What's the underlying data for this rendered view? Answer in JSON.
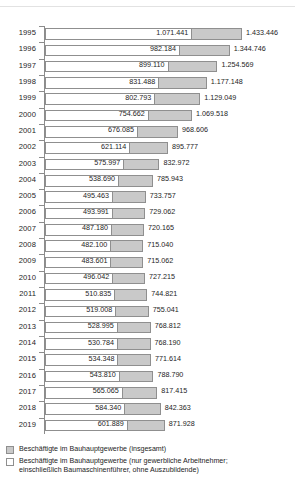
{
  "chart_data": {
    "type": "bar",
    "orientation": "horizontal",
    "title": "",
    "subtitle": "",
    "xlabel": "",
    "ylabel": "",
    "grid": false,
    "legend_position": "bottom-left",
    "xlim": [
      0,
      1433446
    ],
    "categories": [
      "1995",
      "1996",
      "1997",
      "1998",
      "1999",
      "2000",
      "2001",
      "2002",
      "2003",
      "2004",
      "2005",
      "2006",
      "2007",
      "2008",
      "2009",
      "2010",
      "2011",
      "2012",
      "2013",
      "2014",
      "2015",
      "2016",
      "2017",
      "2018",
      "2019"
    ],
    "series": [
      {
        "name": "Beschäftigte im Bauhauptgewerbe (insgesamt)",
        "color": "#c9c9c9",
        "values": [
          1433446,
          1344746,
          1254569,
          1177148,
          1129049,
          1069518,
          968606,
          895777,
          832972,
          785943,
          733757,
          729062,
          720165,
          715040,
          715062,
          727215,
          744821,
          755041,
          768812,
          768190,
          771614,
          788790,
          817415,
          842363,
          871928
        ],
        "labels": [
          "1.433.446",
          "1.344.746",
          "1.254.569",
          "1.177.148",
          "1.129.049",
          "1.069.518",
          "968.606",
          "895.777",
          "832.972",
          "785.943",
          "733.757",
          "729.062",
          "720.165",
          "715.040",
          "715.062",
          "727.215",
          "744.821",
          "755.041",
          "768.812",
          "768.190",
          "771.614",
          "788.790",
          "817.415",
          "842.363",
          "871.928"
        ]
      },
      {
        "name": "Beschäftigte im Bauhauptgewerbe (nur gewerbliche Arbeitnehmer; einschließlich Baumaschinenführer, ohne Auszubildende)",
        "color": "#ffffff",
        "values": [
          1071441,
          982184,
          899110,
          831488,
          802793,
          754662,
          676085,
          621114,
          575997,
          538690,
          495463,
          493991,
          487180,
          482100,
          483601,
          496042,
          510835,
          519008,
          528995,
          530784,
          534348,
          543810,
          565065,
          584340,
          601889
        ],
        "labels": [
          "1.071.441",
          "982.184",
          "899.110",
          "831.488",
          "802.793",
          "754.662",
          "676.085",
          "621.114",
          "575.997",
          "538.690",
          "495.463",
          "493.991",
          "487.180",
          "482.100",
          "483.601",
          "496.042",
          "510.835",
          "519.008",
          "528.995",
          "530.784",
          "534.348",
          "543.810",
          "565.065",
          "584.340",
          "601.889"
        ]
      }
    ]
  },
  "legend": {
    "items": [
      {
        "swatch": "total",
        "line1": "Beschäftigte im Bauhauptgewerbe (insgesamt)",
        "line2": ""
      },
      {
        "swatch": "workers",
        "line1": "Beschäftigte im Bauhauptgewerbe (nur gewerbliche Arbeitnehmer;",
        "line2": "einschließlich Baumaschinenführer, ohne Auszubildende)"
      }
    ]
  },
  "colors": {
    "total_fill": "#c9c9c9",
    "workers_fill": "#ffffff",
    "bar_stroke": "#8f8f8f",
    "axis": "#8c8c8c",
    "text": "#1d1d1d"
  }
}
